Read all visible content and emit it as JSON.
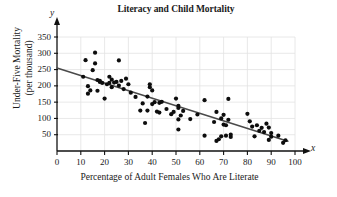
{
  "chart_data": {
    "type": "scatter",
    "title": "Literacy and Child Mortality",
    "xlabel": "Percentage of Adult Females Who Are Literate",
    "ylabel_line1": "Under-Five Mortality",
    "ylabel_line2": "(per thousand)",
    "x_axis_letter": "x",
    "y_axis_letter": "y",
    "xlim": [
      0,
      100
    ],
    "ylim": [
      0,
      350
    ],
    "grid": true,
    "legend": "none",
    "x_ticks": [
      0,
      10,
      20,
      30,
      40,
      50,
      60,
      70,
      80,
      90,
      100
    ],
    "y_ticks": [
      50,
      100,
      150,
      200,
      250,
      300,
      350
    ],
    "x_tick_labels": [
      "0",
      "10",
      "20",
      "30",
      "40",
      "50",
      "60",
      "70",
      "80",
      "90",
      "100"
    ],
    "y_tick_labels": [
      "50",
      "100",
      "150",
      "200",
      "250",
      "300",
      "350"
    ],
    "trendline": {
      "type": "linear",
      "x_start": 0,
      "y_start": 255,
      "x_end": 97,
      "y_end": 30,
      "slope": -2.32,
      "intercept": 255
    },
    "points": [
      [
        11,
        228
      ],
      [
        12,
        279
      ],
      [
        13,
        176
      ],
      [
        13,
        199
      ],
      [
        14,
        186
      ],
      [
        15,
        248
      ],
      [
        16,
        302
      ],
      [
        16,
        269
      ],
      [
        17,
        218
      ],
      [
        17,
        185
      ],
      [
        18,
        212
      ],
      [
        18,
        215
      ],
      [
        19,
        209
      ],
      [
        20,
        161
      ],
      [
        21,
        205
      ],
      [
        22,
        228
      ],
      [
        22,
        209
      ],
      [
        23,
        219
      ],
      [
        23,
        196
      ],
      [
        24,
        210
      ],
      [
        25,
        212
      ],
      [
        26,
        278
      ],
      [
        26,
        201
      ],
      [
        27,
        215
      ],
      [
        28,
        190
      ],
      [
        29,
        222
      ],
      [
        30,
        205
      ],
      [
        31,
        179
      ],
      [
        33,
        166
      ],
      [
        35,
        124
      ],
      [
        36,
        146
      ],
      [
        37,
        86
      ],
      [
        38,
        167
      ],
      [
        38,
        124
      ],
      [
        39,
        205
      ],
      [
        39,
        196
      ],
      [
        40,
        144
      ],
      [
        40,
        186
      ],
      [
        41,
        150
      ],
      [
        42,
        121
      ],
      [
        43,
        148
      ],
      [
        43,
        118
      ],
      [
        44,
        151
      ],
      [
        46,
        129
      ],
      [
        48,
        113
      ],
      [
        49,
        120
      ],
      [
        50,
        161
      ],
      [
        51,
        97
      ],
      [
        51,
        132
      ],
      [
        51,
        139
      ],
      [
        51,
        66
      ],
      [
        52,
        109
      ],
      [
        53,
        123
      ],
      [
        56,
        98
      ],
      [
        59,
        112
      ],
      [
        62,
        156
      ],
      [
        62,
        47
      ],
      [
        66,
        89
      ],
      [
        67,
        31
      ],
      [
        67,
        120
      ],
      [
        68,
        36
      ],
      [
        69,
        100
      ],
      [
        69,
        45
      ],
      [
        70,
        111
      ],
      [
        70,
        81
      ],
      [
        71,
        79
      ],
      [
        71,
        47
      ],
      [
        72,
        96
      ],
      [
        72,
        160
      ],
      [
        73,
        43
      ],
      [
        73,
        50
      ],
      [
        80,
        114
      ],
      [
        81,
        91
      ],
      [
        82,
        75
      ],
      [
        83,
        45
      ],
      [
        84,
        79
      ],
      [
        85,
        62
      ],
      [
        86,
        71
      ],
      [
        87,
        58
      ],
      [
        88,
        84
      ],
      [
        89,
        72
      ],
      [
        89,
        34
      ],
      [
        90,
        55
      ],
      [
        90,
        44
      ],
      [
        93,
        47
      ],
      [
        95,
        25
      ],
      [
        96,
        33
      ]
    ]
  }
}
